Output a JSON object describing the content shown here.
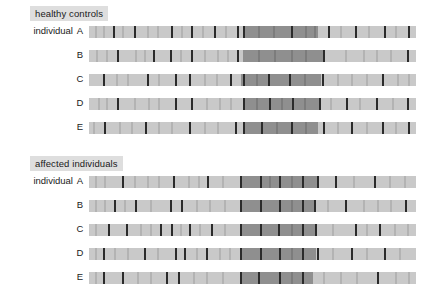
{
  "figure": {
    "type": "haplotype-marker-diagram",
    "width": 430,
    "height": 300,
    "background": "#ffffff",
    "colors": {
      "bar_background": "#c9c9c9",
      "shared_block": "#8f8f8f",
      "marker_dark": "#2b2b2b",
      "marker_faint": "#b3b3b3",
      "panel_title_background": "#dedede",
      "text": "#1a1a1a"
    },
    "bar_geometry": {
      "left_px": 89,
      "width_px": 327,
      "height_px": 12,
      "row_spacing_px": 24
    }
  },
  "panels": [
    {
      "key": "healthy",
      "title": "healthy controls",
      "row_prefix": "individual",
      "rows": [
        {
          "id": "A",
          "block": {
            "start_pct": 47.0,
            "end_pct": 70.0
          },
          "dark_markers_pct": [
            7.5,
            14.0,
            25.5,
            31.5,
            38.5,
            45.5,
            47.5,
            62.0,
            73.5,
            81.5,
            90.5,
            98.0
          ],
          "faint_markers_pct": [
            2.0,
            4.5,
            10.5,
            18.0,
            21.0,
            28.5,
            35.0,
            42.0,
            52.0,
            56.5,
            66.5,
            69.0,
            77.0,
            85.5,
            94.0
          ]
        },
        {
          "id": "B",
          "block": {
            "start_pct": 47.0,
            "end_pct": 71.5
          },
          "dark_markers_pct": [
            9.0,
            20.0,
            25.0,
            31.5,
            45.5,
            72.0,
            97.5
          ],
          "faint_markers_pct": [
            2.5,
            5.5,
            14.5,
            17.0,
            28.0,
            35.5,
            39.5,
            42.5,
            52.0,
            57.0,
            62.0,
            66.5,
            78.5,
            84.0,
            88.0,
            92.5
          ]
        },
        {
          "id": "C",
          "block": {
            "start_pct": 46.5,
            "end_pct": 71.0
          },
          "dark_markers_pct": [
            4.5,
            18.0,
            26.5,
            31.0,
            43.5,
            47.5,
            55.0,
            61.5,
            71.5,
            90.0
          ],
          "faint_markers_pct": [
            8.5,
            12.0,
            21.5,
            35.5,
            39.0,
            51.5,
            66.0,
            76.0,
            80.5,
            85.0,
            94.5,
            98.0
          ]
        },
        {
          "id": "D",
          "block": {
            "start_pct": 47.0,
            "end_pct": 70.5
          },
          "dark_markers_pct": [
            9.0,
            26.5,
            31.5,
            47.5,
            55.5,
            62.5,
            70.5,
            79.0,
            88.0,
            97.5
          ],
          "faint_markers_pct": [
            3.0,
            5.5,
            14.0,
            18.5,
            21.5,
            36.0,
            40.0,
            43.5,
            51.5,
            59.0,
            66.0,
            74.0,
            83.0,
            93.0
          ]
        },
        {
          "id": "E",
          "block": {
            "start_pct": 47.0,
            "end_pct": 70.0
          },
          "dark_markers_pct": [
            5.0,
            17.5,
            31.0,
            45.0,
            47.5,
            53.0,
            62.0,
            72.0,
            80.5,
            90.0,
            98.0
          ],
          "faint_markers_pct": [
            1.5,
            9.5,
            13.0,
            21.5,
            25.5,
            35.5,
            39.5,
            57.5,
            66.5,
            76.0,
            85.0,
            94.0
          ]
        }
      ]
    },
    {
      "key": "affected",
      "title": "affected individuals",
      "row_prefix": "individual",
      "rows": [
        {
          "id": "A",
          "block": {
            "start_pct": 46.5,
            "end_pct": 70.0
          },
          "dark_markers_pct": [
            10.5,
            26.0,
            36.5,
            46.5,
            52.5,
            58.5,
            65.5,
            70.0,
            75.5,
            87.5
          ],
          "faint_markers_pct": [
            2.0,
            5.0,
            14.0,
            18.0,
            21.5,
            30.5,
            33.5,
            41.0,
            55.5,
            62.0,
            81.0,
            92.0,
            96.5
          ]
        },
        {
          "id": "B",
          "block": {
            "start_pct": 46.5,
            "end_pct": 69.0
          },
          "dark_markers_pct": [
            8.0,
            14.5,
            25.0,
            28.5,
            46.5,
            52.5,
            58.5,
            65.5,
            69.0,
            78.5,
            97.0
          ],
          "faint_markers_pct": [
            2.0,
            5.0,
            11.0,
            19.0,
            33.0,
            37.0,
            41.5,
            62.0,
            73.0,
            84.0,
            88.5,
            92.5
          ]
        },
        {
          "id": "C",
          "block": {
            "start_pct": 46.5,
            "end_pct": 69.5
          },
          "dark_markers_pct": [
            6.0,
            11.5,
            22.0,
            25.5,
            31.0,
            37.5,
            46.5,
            52.5,
            58.0,
            65.5,
            69.5,
            81.5,
            89.0
          ],
          "faint_markers_pct": [
            2.0,
            16.0,
            19.0,
            28.0,
            34.0,
            41.5,
            62.0,
            74.5,
            85.0,
            93.5,
            97.5
          ]
        },
        {
          "id": "D",
          "block": {
            "start_pct": 46.5,
            "end_pct": 69.5
          },
          "dark_markers_pct": [
            4.5,
            17.0,
            26.5,
            29.5,
            36.0,
            46.5,
            52.5,
            58.5,
            65.5,
            70.0,
            80.5,
            90.5
          ],
          "faint_markers_pct": [
            2.0,
            8.0,
            12.0,
            21.0,
            33.0,
            40.0,
            43.0,
            62.0,
            74.5,
            85.0,
            95.0
          ]
        },
        {
          "id": "E",
          "block": {
            "start_pct": 46.5,
            "end_pct": 68.5
          },
          "dark_markers_pct": [
            4.5,
            10.5,
            24.0,
            27.5,
            46.5,
            52.0,
            58.5,
            65.5,
            88.5
          ],
          "faint_markers_pct": [
            2.0,
            15.0,
            19.0,
            32.0,
            36.0,
            41.0,
            62.0,
            72.0,
            77.0,
            82.0,
            94.0,
            98.0
          ]
        }
      ]
    }
  ]
}
